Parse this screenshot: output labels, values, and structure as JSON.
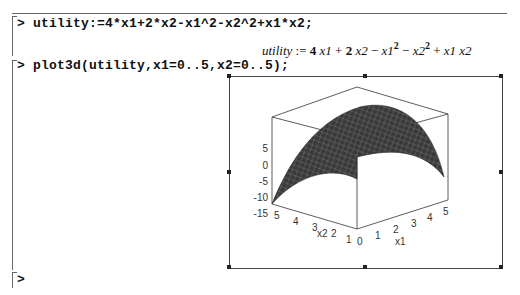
{
  "worksheet": {
    "inputs": [
      {
        "prompt": ">",
        "command": "utility:=4*x1+2*x2-x1^2-x2^2+x1*x2;"
      },
      {
        "prompt": ">",
        "command": "plot3d(utility,x1=0..5,x2=0..5);"
      },
      {
        "prompt": ">",
        "command": ""
      }
    ],
    "output": {
      "lhs": "utility",
      "assign": ":=",
      "terms": [
        "4",
        "x1",
        "+",
        "2",
        "x2",
        "−",
        "x1",
        "2",
        "−",
        "x2",
        "2",
        "+",
        "x1",
        "x2"
      ]
    }
  },
  "plot": {
    "type": "plot3d",
    "function": "4*x1+2*x2-x1^2-x2^2+x1*x2",
    "x_axis": {
      "label": "x1",
      "ticks": [
        "0",
        "1",
        "2",
        "3",
        "4",
        "5"
      ]
    },
    "y_axis": {
      "label": "x2",
      "ticks": [
        "1",
        "2",
        "3",
        "4",
        "5"
      ]
    },
    "z_axis": {
      "ticks": [
        "5",
        "0",
        "-5",
        "-10",
        "-15"
      ]
    },
    "surface_color": "#3a3a3a"
  }
}
